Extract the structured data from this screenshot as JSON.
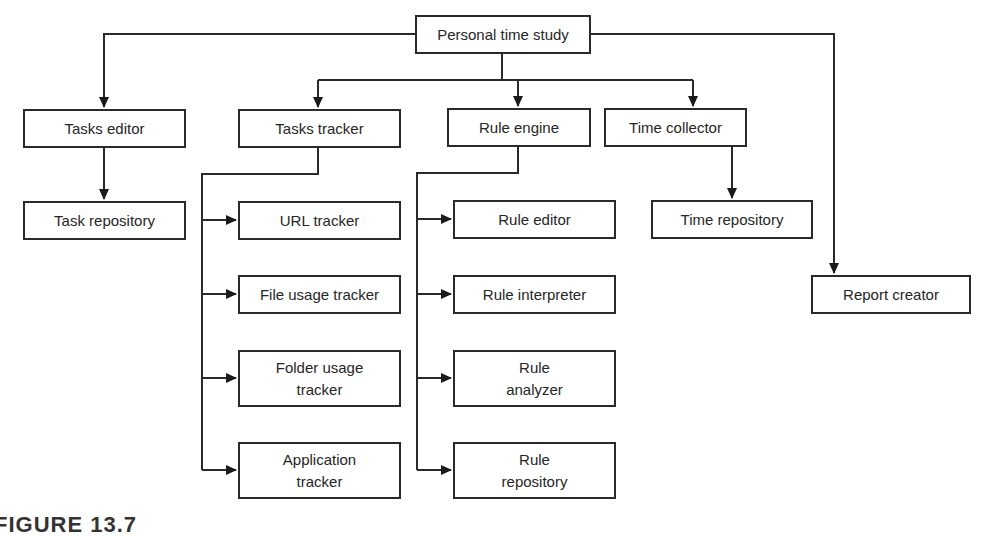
{
  "diagram": {
    "type": "hierarchy",
    "root": "Personal time study",
    "nodes": {
      "personal_time_study": "Personal time study",
      "tasks_editor": "Tasks editor",
      "tasks_tracker": "Tasks tracker",
      "rule_engine": "Rule engine",
      "time_collector": "Time collector",
      "task_repository": "Task repository",
      "url_tracker": "URL tracker",
      "file_usage_tracker": "File usage tracker",
      "folder_usage_tracker": "Folder usage\ntracker",
      "application_tracker": "Application\ntracker",
      "rule_editor": "Rule editor",
      "rule_interpreter": "Rule interpreter",
      "rule_analyzer": "Rule\nanalyzer",
      "rule_repository": "Rule\nrepository",
      "time_repository": "Time repository",
      "report_creator": "Report creator"
    },
    "edges": [
      [
        "Personal time study",
        "Tasks editor"
      ],
      [
        "Personal time study",
        "Tasks tracker"
      ],
      [
        "Personal time study",
        "Rule engine"
      ],
      [
        "Personal time study",
        "Time collector"
      ],
      [
        "Personal time study",
        "Report creator"
      ],
      [
        "Tasks editor",
        "Task repository"
      ],
      [
        "Tasks tracker",
        "URL tracker"
      ],
      [
        "Tasks tracker",
        "File usage tracker"
      ],
      [
        "Tasks tracker",
        "Folder usage tracker"
      ],
      [
        "Tasks tracker",
        "Application tracker"
      ],
      [
        "Rule engine",
        "Rule editor"
      ],
      [
        "Rule engine",
        "Rule interpreter"
      ],
      [
        "Rule engine",
        "Rule analyzer"
      ],
      [
        "Rule engine",
        "Rule repository"
      ],
      [
        "Time collector",
        "Time repository"
      ]
    ]
  },
  "caption": "FIGURE 13.7"
}
